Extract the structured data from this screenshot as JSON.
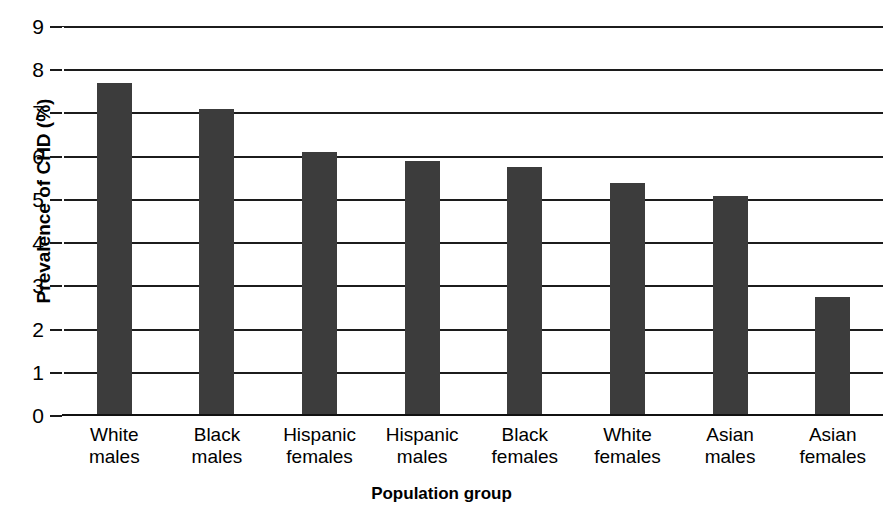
{
  "chart_data": {
    "type": "bar",
    "title": "",
    "subtitle": "",
    "xlabel": "Population group",
    "ylabel": "Prevalence of CHD (%)",
    "categories": [
      "White\nmales",
      "Black\nmales",
      "Hispanic\nfemales",
      "Hispanic\nmales",
      "Black\nfemales",
      "White\nfemales",
      "Asian\nmales",
      "Asian\nfemales"
    ],
    "values": [
      7.7,
      7.1,
      6.1,
      5.9,
      5.75,
      5.4,
      5.1,
      2.75
    ],
    "ylim": [
      0,
      9
    ],
    "ytick_labels": [
      "9",
      "8",
      "7",
      "6",
      "5",
      "4",
      "3",
      "2",
      "1",
      "0"
    ],
    "ytick_values": [
      9,
      8,
      7,
      6,
      5,
      4,
      3,
      2,
      1,
      0
    ],
    "grid": true,
    "legend": "none",
    "bar_color": "#3c3c3c",
    "axis_color": "#1c1c1c",
    "background_color": "#ffffff"
  }
}
